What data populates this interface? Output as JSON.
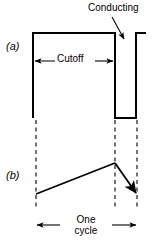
{
  "figure": {
    "title": "",
    "panels": [
      {
        "id": "a",
        "label": "(a)",
        "description": "rectangular collector-voltage waveform with cutoff interval and narrow conducting notch"
      },
      {
        "id": "b",
        "label": "(b)",
        "description": "sawtooth waveform showing one cycle"
      }
    ],
    "annotations": {
      "conducting": "Conducting",
      "cutoff": "Cutoff",
      "one_cycle_line1": "One",
      "one_cycle_line2": "cycle"
    },
    "colors": {
      "ink": "#000000",
      "background": "#ffffff"
    }
  },
  "chart_data": {
    "type": "line",
    "title": "",
    "xlabel": "",
    "ylabel": "",
    "xlim": [
      0,
      160
    ],
    "ylim": [
      0,
      250
    ],
    "grid": false,
    "legend": null,
    "series": [
      {
        "name": "waveform-a-pulse",
        "panel": "a",
        "points": [
          [
            33,
            118
          ],
          [
            33,
            33
          ],
          [
            115,
            33
          ],
          [
            115,
            118
          ],
          [
            136,
            118
          ],
          [
            136,
            33
          ],
          [
            146,
            33
          ]
        ]
      },
      {
        "name": "waveform-b-sawtooth",
        "panel": "b",
        "points": [
          [
            36,
            194
          ],
          [
            115,
            163
          ],
          [
            137,
            195
          ]
        ]
      }
    ],
    "reference_lines": [
      {
        "name": "cycle-start",
        "x": 36,
        "y0": 120,
        "y1": 207,
        "style": "dashed"
      },
      {
        "name": "conduction-start",
        "x": 115,
        "y0": 120,
        "y1": 207,
        "style": "dashed"
      },
      {
        "name": "cycle-end",
        "x": 137,
        "y0": 120,
        "y1": 207,
        "style": "dashed"
      }
    ],
    "dimensions": [
      {
        "name": "cutoff-span",
        "label": "Cutoff",
        "x0": 33,
        "x1": 115,
        "y": 61
      },
      {
        "name": "one-cycle-span",
        "label": "One cycle",
        "x0": 36,
        "x1": 137,
        "y": 225
      }
    ],
    "callouts": [
      {
        "name": "conducting-callout",
        "label": "Conducting",
        "text_x": 88,
        "text_y": 3,
        "tip_x": 124,
        "tip_y": 40
      }
    ]
  }
}
